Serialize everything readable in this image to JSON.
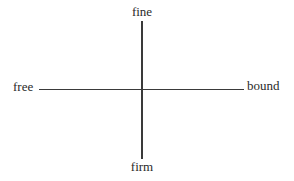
{
  "diagram": {
    "type": "two-axis cross",
    "axes": {
      "vertical": {
        "top_label": "fine",
        "bottom_label": "firm"
      },
      "horizontal": {
        "left_label": "free",
        "right_label": "bound"
      }
    },
    "colors": {
      "line": "#3a3a3a",
      "text": "#2a2a2a",
      "background": "#ffffff"
    }
  }
}
